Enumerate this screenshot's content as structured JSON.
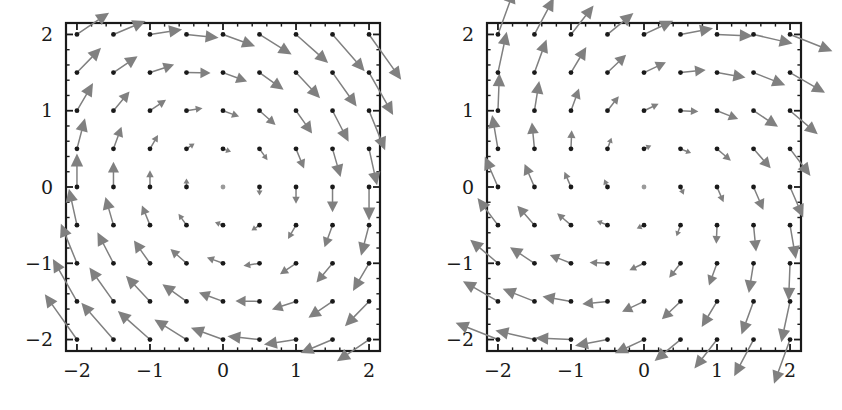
{
  "figure": {
    "title": "",
    "background_color": "#ffffff",
    "width": 842,
    "height": 410,
    "panel_count": 2
  },
  "style": {
    "frame_color": "#1a1a1a",
    "arrow_color": "#808080",
    "point_color": "#1a1a1a",
    "tick_color": "#1a1a1a",
    "label_color": "#1a1a1a"
  },
  "axis": {
    "x_ticks": [
      "-2",
      "-1",
      "0",
      "1",
      "2"
    ],
    "y_ticks": [
      "-2",
      "-1",
      "0",
      "1",
      "2"
    ],
    "x_tick_values": [
      -2,
      -1,
      0,
      1,
      2
    ],
    "y_tick_values": [
      -2,
      -1,
      0,
      1,
      2
    ],
    "minor_tick_step": 0.2,
    "xlim": [
      -2.15,
      2.15
    ],
    "ylim": [
      -2.15,
      2.15
    ],
    "xlabel": "",
    "ylabel": "",
    "grid": false
  },
  "chart_data": [
    {
      "type": "scatter",
      "subtype": "vector-field",
      "name": "left-vector-field",
      "title": "",
      "xlabel": "",
      "ylabel": "",
      "xlim": [
        -2.15,
        2.15
      ],
      "ylim": [
        -2.15,
        2.15
      ],
      "xticks": [
        -2,
        -1,
        0,
        1,
        2
      ],
      "yticks": [
        -2,
        -1,
        0,
        1,
        2
      ],
      "xticklabels": [
        "-2",
        "-1",
        "0",
        "1",
        "2"
      ],
      "yticklabels": [
        "-2",
        "-1",
        "0",
        "1",
        "2"
      ],
      "grid": false,
      "legend": null,
      "grid_x": [
        -2,
        -1.5,
        -1,
        -0.5,
        0,
        0.5,
        1,
        1.5,
        2
      ],
      "grid_y": [
        -2,
        -1.5,
        -1,
        -0.5,
        0,
        0.5,
        1,
        1.5,
        2
      ],
      "field_formula": "u = y,  v = -x - 0.35*y",
      "field_u_coeff": {
        "x": 0.0,
        "y": 1.0
      },
      "field_v_coeff": {
        "x": -1.0,
        "y": -0.35
      },
      "arrow_scale": 0.22,
      "zero_vector_points": [
        [
          0,
          0
        ]
      ],
      "description": "Clockwise spiral vector field; arrows emanate from black dots at each grid node; origin is a fixed point with no arrow."
    },
    {
      "type": "scatter",
      "subtype": "vector-field",
      "name": "right-vector-field",
      "title": "",
      "xlabel": "",
      "ylabel": "",
      "xlim": [
        -2.15,
        2.15
      ],
      "ylim": [
        -2.15,
        2.15
      ],
      "xticks": [
        -2,
        -1,
        0,
        1,
        2
      ],
      "yticks": [
        -2,
        -1,
        0,
        1,
        2
      ],
      "xticklabels": [
        "-2",
        "-1",
        "0",
        "1",
        "2"
      ],
      "yticklabels": [
        "-2",
        "-1",
        "0",
        "1",
        "2"
      ],
      "grid": false,
      "legend": null,
      "grid_x": [
        -2,
        -1.5,
        -1,
        -0.5,
        0,
        0.5,
        1,
        1.5,
        2
      ],
      "grid_y": [
        -2,
        -1.5,
        -1,
        -0.5,
        0,
        0.5,
        1,
        1.5,
        2
      ],
      "field_formula": "u = y + 0.45*x,  v = -x + 0.45*y",
      "field_u_coeff": {
        "x": 0.45,
        "y": 1.0
      },
      "field_v_coeff": {
        "x": -1.0,
        "y": 0.45
      },
      "arrow_scale": 0.2,
      "zero_vector_points": [
        [
          0,
          0
        ]
      ],
      "description": "Clockwise outward spiral vector field; arrows emanate from black dots at each grid node; origin is a fixed point with no arrow."
    }
  ]
}
